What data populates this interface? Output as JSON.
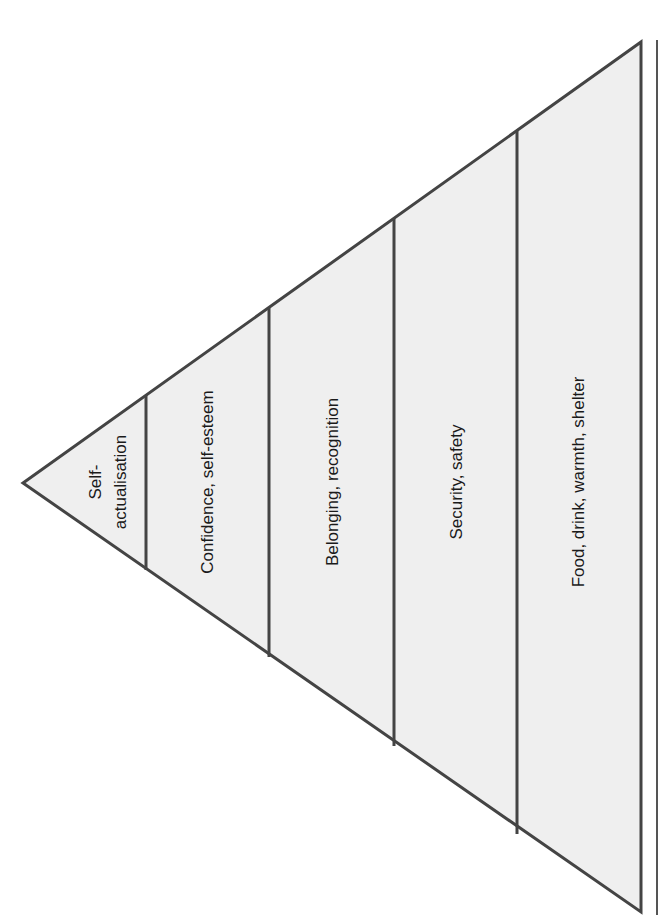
{
  "diagram": {
    "type": "hierarchy-pyramid",
    "orientation": "rotated-apex-left",
    "colors": {
      "fill": "#efefef",
      "stroke": "#444444",
      "text": "#1a1a1a",
      "background": "#ffffff"
    },
    "levels": [
      {
        "label_line1": "Self-",
        "label_line2": "actualisation"
      },
      {
        "label": "Confidence, self-esteem"
      },
      {
        "label": "Belonging, recognition"
      },
      {
        "label": "Security, safety"
      },
      {
        "label": "Food, drink, warmth, shelter"
      }
    ]
  }
}
